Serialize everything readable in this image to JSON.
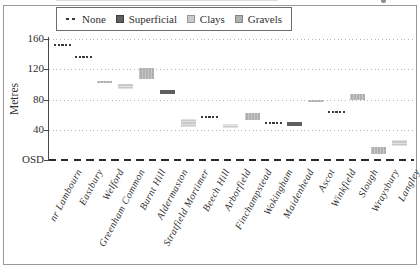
{
  "colors": {
    "superficial": "#5f5f5f",
    "clays": "#c9c9c9",
    "gravels": "#b0b0b0",
    "dash": "#3a3a3a",
    "grid": "#b4b4b4",
    "axis": "#4a4a4a",
    "osd": "#2b2b2b",
    "border": "#9a9a9a",
    "legend_border": "#6e6e6e",
    "text": "#2f2f2f"
  },
  "legend": {
    "items": [
      {
        "label": "None",
        "type": "dash"
      },
      {
        "label": "Superficial",
        "type": "swatch"
      },
      {
        "label": "Clays",
        "type": "swatch"
      },
      {
        "label": "Gravels",
        "type": "swatch"
      }
    ]
  },
  "y_axis": {
    "label": "Metres",
    "datum_label": "OSD"
  },
  "chart_data": {
    "type": "bar",
    "variant": "floating-interval-strip",
    "title": "",
    "xlabel": "",
    "ylabel": "Metres",
    "ylim": [
      0,
      170
    ],
    "grid": "dotted-horizontal",
    "legend_position": "top",
    "yticks": [
      {
        "label": "OSD",
        "value": 0
      },
      {
        "label": "40",
        "value": 40
      },
      {
        "label": "80",
        "value": 80
      },
      {
        "label": "120",
        "value": 120
      },
      {
        "label": "160",
        "value": 160
      }
    ],
    "categories": [
      "nr Lambourn",
      "Eastbury",
      "Welford",
      "Greenham Common",
      "Burnt Hill",
      "Aldermaston",
      "Stratfield Mortimer",
      "Beech Hill",
      "Arborfield",
      "Finchampstead",
      "Wokingham",
      "Maidenhead",
      "Ascot",
      "Winkfield",
      "Slough",
      "Wraysbury",
      "Langley"
    ],
    "points": [
      {
        "location": "nr Lambourn",
        "cover": "None",
        "top": 152,
        "base": 152
      },
      {
        "location": "Eastbury",
        "cover": "None",
        "top": 136,
        "base": 136
      },
      {
        "location": "Welford",
        "cover": "Gravels",
        "top": 105,
        "base": 103
      },
      {
        "location": "Greenham Common",
        "cover": "Clays",
        "top": 100,
        "base": 94
      },
      {
        "location": "Burnt Hill",
        "cover": "Gravels",
        "top": 121,
        "base": 107
      },
      {
        "location": "Aldermaston",
        "cover": "Superficial",
        "top": 93,
        "base": 87
      },
      {
        "location": "Stratfield Mortimer",
        "cover": "Clays",
        "top": 54,
        "base": 44
      },
      {
        "location": "Beech Hill",
        "cover": "None",
        "top": 57,
        "base": 57
      },
      {
        "location": "Arborfield",
        "cover": "Clays",
        "top": 48,
        "base": 43
      },
      {
        "location": "Finchampstead",
        "cover": "Gravels",
        "top": 62,
        "base": 53
      },
      {
        "location": "Wokingham",
        "cover": "None",
        "top": 49,
        "base": 49
      },
      {
        "location": "Maidenhead",
        "cover": "Superficial",
        "top": 51,
        "base": 45
      },
      {
        "location": "Ascot",
        "cover": "Gravels",
        "top": 80,
        "base": 78
      },
      {
        "location": "Winkfield",
        "cover": "None",
        "top": 63,
        "base": 63
      },
      {
        "location": "Slough",
        "cover": "Gravels",
        "top": 87,
        "base": 80
      },
      {
        "location": "Wraysbury",
        "cover": "Gravels",
        "top": 17,
        "base": 8
      },
      {
        "location": "Langley",
        "cover": "Clays",
        "top": 27,
        "base": 19
      }
    ]
  }
}
